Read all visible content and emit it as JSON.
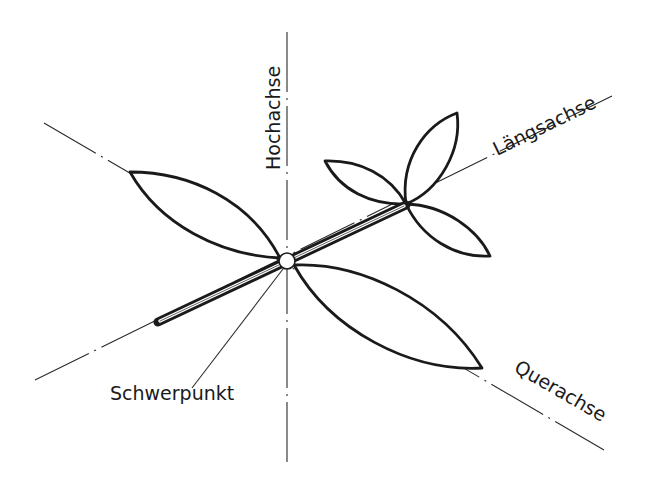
{
  "diagram": {
    "labels": {
      "vertical_axis": "Hochachse",
      "longitudinal_axis": "Längsachse",
      "transverse_axis": "Querachse",
      "center_of_gravity": "Schwerpunkt"
    },
    "colors": {
      "background": "#ffffff",
      "ink": "#1a1a1a"
    }
  }
}
